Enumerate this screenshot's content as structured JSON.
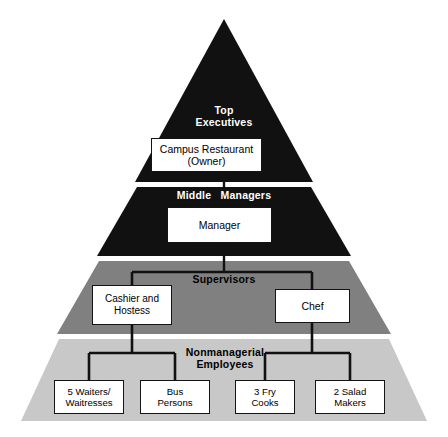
{
  "diagram": {
    "type": "organizational-pyramid",
    "background_color": "#ffffff",
    "tiers": [
      {
        "id": "top-executives",
        "label": "Top\nExecutives",
        "band_color": "#111111",
        "label_color": "#ffffff",
        "nodes": [
          {
            "id": "owner",
            "label": "Campus Restaurant\n(Owner)"
          }
        ]
      },
      {
        "id": "middle-managers",
        "label": "Middle   Managers",
        "band_color": "#111111",
        "label_color": "#ffffff",
        "nodes": [
          {
            "id": "manager",
            "label": "Manager"
          }
        ]
      },
      {
        "id": "supervisors",
        "label": "Supervisors",
        "band_color": "#808080",
        "label_color": "#000000",
        "nodes": [
          {
            "id": "cashier",
            "label": "Cashier and\nHostess"
          },
          {
            "id": "chef",
            "label": "Chef"
          }
        ]
      },
      {
        "id": "nonmanagerial-employees",
        "label": "Nonmanagerial\nEmployees",
        "band_color": "#c8c8c8",
        "label_color": "#000000",
        "nodes": [
          {
            "id": "waiters",
            "label": "5 Waiters/\nWaitresses"
          },
          {
            "id": "bus",
            "label": "Bus\nPersons"
          },
          {
            "id": "fry",
            "label": "3 Fry\nCooks"
          },
          {
            "id": "salad",
            "label": "2 Salad\nMakers"
          }
        ]
      }
    ],
    "connector_color": "#111111"
  }
}
